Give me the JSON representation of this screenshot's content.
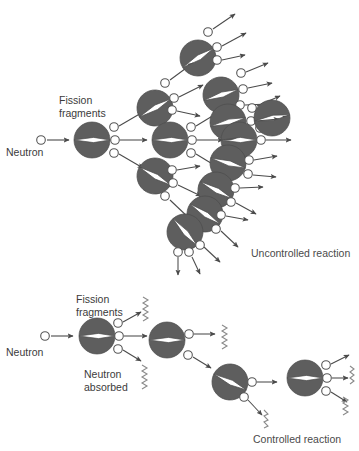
{
  "figure": {
    "title_visible": false,
    "background_color": "#ffffff",
    "nucleus_fill": "#5e5e5e",
    "nucleus_stroke": "#4a4a4a",
    "neutron_fill": "#ffffff",
    "neutron_stroke": "#555555",
    "arrow_color": "#4a4a4a",
    "squiggle_color": "#8a8a8a",
    "text_color": "#3b3b3b"
  },
  "labels": {
    "neutron_top": "Neutron",
    "fission_fragments_top": "Fission\nfragments",
    "fission_fragments_top_line1": "Fission",
    "fission_fragments_top_line2": "fragments",
    "uncontrolled_caption": "Uncontrolled reaction",
    "neutron_bottom": "Neutron",
    "fission_fragments_bottom_line1": "Fission",
    "fission_fragments_bottom_line2": "fragments",
    "neutron_absorbed_line1": "Neutron",
    "neutron_absorbed_line2": "absorbed",
    "controlled_caption": "Controlled reaction"
  },
  "diagrams": [
    {
      "id": "uncontrolled",
      "name": "Uncontrolled chain reaction",
      "caption": "Uncontrolled reaction",
      "description": "A single incoming neutron strikes a nucleus which fissions into two fragments and releases three neutrons; each released neutron strikes a further nucleus, multiplying exponentially through four generations.",
      "generations": 4,
      "neutrons_per_fission": 3,
      "nuclei_count": 13,
      "absorbed_neutrons": 0,
      "escaping_neutrons": 21
    },
    {
      "id": "controlled",
      "name": "Controlled chain reaction",
      "caption": "Controlled reaction",
      "description": "A single incoming neutron causes fission releasing three neutrons, but all but one are absorbed (shown as squiggles), so exactly one neutron continues the chain at each step.",
      "generations": 4,
      "neutrons_per_fission": 3,
      "nuclei_count": 4,
      "absorbed_neutrons": 6,
      "escaping_neutrons": 1
    }
  ],
  "legend_items": [
    {
      "key": "nucleus",
      "label": "Fission fragments",
      "shape": "split-disc"
    },
    {
      "key": "neutron",
      "label": "Neutron",
      "shape": "small-open-circle"
    },
    {
      "key": "absorbed",
      "label": "Neutron absorbed",
      "shape": "squiggle"
    }
  ]
}
